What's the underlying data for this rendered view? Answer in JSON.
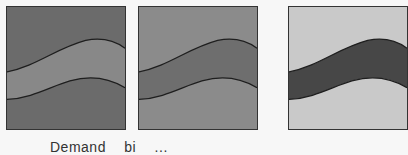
{
  "figure": {
    "panels": [
      {
        "id": "panel-1",
        "background": "#6b6b6b",
        "band": "#888888",
        "stroke": "#1e1e1e"
      },
      {
        "id": "panel-2",
        "background": "#8b8b8b",
        "band": "#6e6e6e",
        "stroke": "#1e1e1e"
      },
      {
        "id": "panel-3",
        "background": "#c9c9c9",
        "band": "#474747",
        "stroke": "#1e1e1e"
      }
    ],
    "caption_words": [
      "Demand",
      "bi",
      "..."
    ]
  }
}
